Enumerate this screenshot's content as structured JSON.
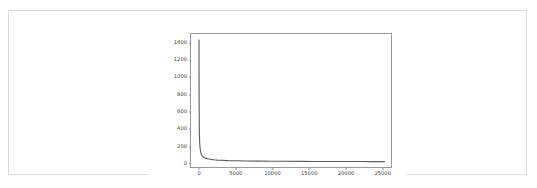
{
  "card": {
    "border_color": "#dcdcdc",
    "background": "#ffffff"
  },
  "chart_data": {
    "type": "line",
    "title": "",
    "subtitle": "",
    "xlabel": "",
    "ylabel": "",
    "legend": [],
    "grid": false,
    "legend_position": "none",
    "line_color": "#5a5a5a",
    "axis_color": "#9a9a9a",
    "tick_label_color": "#3a3a3a",
    "xlim": [
      -1100,
      26400
    ],
    "ylim": [
      -60,
      1500
    ],
    "xticks": [
      0,
      5000,
      10000,
      15000,
      20000,
      25000
    ],
    "xtick_labels": [
      "0",
      "5000",
      "10000",
      "15000",
      "20000",
      "25000"
    ],
    "yticks": [
      0,
      200,
      400,
      600,
      800,
      1000,
      1200,
      1400
    ],
    "ytick_labels": [
      "0",
      "200",
      "400",
      "600",
      "800",
      "1000",
      "1200",
      "1400"
    ],
    "series": [
      {
        "name": "frequency",
        "x": [
          1,
          5,
          10,
          20,
          30,
          50,
          75,
          100,
          150,
          200,
          300,
          400,
          500,
          700,
          900,
          1200,
          1500,
          2000,
          2500,
          3000,
          4000,
          5000,
          6500,
          8000,
          10000,
          12000,
          14000,
          16000,
          18000,
          20000,
          22000,
          24000,
          25500
        ],
        "y": [
          1432,
          1180,
          900,
          640,
          500,
          360,
          270,
          215,
          160,
          128,
          95,
          78,
          66,
          52,
          44,
          36,
          31,
          25,
          21,
          19,
          15,
          13,
          11,
          9,
          8,
          7,
          6,
          5,
          5,
          4,
          4,
          3,
          3
        ]
      }
    ]
  }
}
